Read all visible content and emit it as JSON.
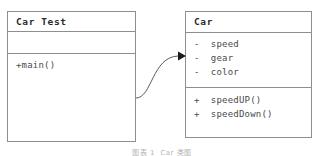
{
  "diagram": {
    "type": "uml-class-diagram",
    "colors": {
      "background": "#ffffff",
      "border": "#8e8e8e",
      "text": "#3a3a3a",
      "title_text": "#2b2b2b",
      "connector": "#5a5a5a",
      "caption_text": "#b4b4b4"
    },
    "classes": [
      {
        "id": "car-test",
        "name": "Car Test",
        "attributes": [],
        "operations": [
          "+main()"
        ]
      },
      {
        "id": "car",
        "name": "Car",
        "attributes": [
          "-  speed",
          "-  gear",
          "-  color"
        ],
        "operations": [
          "+  speedUP()",
          "+  speedDown()"
        ]
      }
    ],
    "connector": {
      "kind": "association-arrow",
      "from": "car-test",
      "to": "car",
      "arrowhead": "filled-triangle"
    },
    "caption": "图表 1  Car 类图"
  }
}
